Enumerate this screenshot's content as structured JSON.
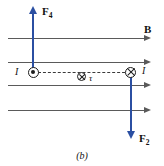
{
  "figure": {
    "caption": "(b)",
    "field_label": "B",
    "force_up": {
      "symbol": "F",
      "subscript": "4"
    },
    "force_down": {
      "symbol": "F",
      "subscript": "2"
    },
    "current_left_label": "I",
    "current_right_label": "I",
    "torque_label": "τ",
    "current_out_of_page_icon": "circle-dot-icon",
    "current_into_page_icon": "circle-cross-icon",
    "torque_icon": "circle-cross-icon",
    "colors": {
      "force_vector": "#2b4fa2",
      "field_line": "#5a5a5a",
      "symbol_stroke": "#1c1c1c",
      "background": "#ffffff"
    },
    "field_lines": [
      {
        "y": 38,
        "x_start": 8,
        "x_end": 150
      },
      {
        "y": 62,
        "x_start": 8,
        "x_end": 150
      },
      {
        "y": 85,
        "x_start": 8,
        "x_end": 150
      },
      {
        "y": 110,
        "x_start": 8,
        "x_end": 150
      }
    ],
    "field_line_count": 4,
    "dashed_axis": {
      "y": 72,
      "x_start": 38,
      "x_end": 128
    }
  }
}
